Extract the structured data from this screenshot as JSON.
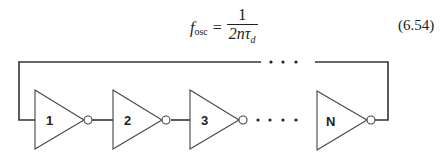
{
  "equation": {
    "lhs_symbol": "f",
    "lhs_subscript": "osc",
    "equals": "=",
    "numerator": "1",
    "denominator_main": "2nτ",
    "denominator_subscript": "d",
    "number": "(6.54)"
  },
  "circuit": {
    "type": "ring oscillator",
    "inverters": [
      {
        "label": "1"
      },
      {
        "label": "2"
      },
      {
        "label": "3"
      },
      {
        "label": "N"
      }
    ],
    "ellipsis_top": "• • •",
    "ellipsis_bottom": "• • • •",
    "line_color": "#333333"
  }
}
